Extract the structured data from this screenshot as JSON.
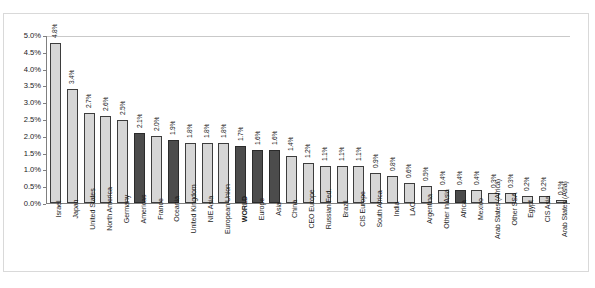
{
  "chart_data": {
    "type": "bar",
    "title": "",
    "subtitle": "",
    "xlabel": "",
    "ylabel": "",
    "ylim": [
      0,
      5.0
    ],
    "ytick_labels": [
      "5.0%",
      "4.5%",
      "4.0%",
      "3.5%",
      "3.0%",
      "2.5%",
      "2.0%",
      "1.5%",
      "1.0%",
      "0.5%",
      "0.0%"
    ],
    "ytick_values": [
      5.0,
      4.5,
      4.0,
      3.5,
      3.0,
      2.5,
      2.0,
      1.5,
      1.0,
      0.5,
      0.0
    ],
    "grid": false,
    "legend": "none",
    "value_label_suffix": "%",
    "colors": {
      "bar_light": "#d6d6d6",
      "bar_dark": "#4c4c4c",
      "bar_border": "#3d3d3d",
      "axis": "#808080",
      "frame": "#d9d9d9",
      "text": "#1a1a1a"
    },
    "categories": [
      "Israel",
      "Japan",
      "United States",
      "North America",
      "Germany",
      "Americas",
      "France",
      "Oceania",
      "United Kingdom",
      "NIE Asia",
      "European Union",
      "WORLD",
      "Europe",
      "Asia",
      "China",
      "CEO Europe",
      "Russian Fed.",
      "Brazil",
      "CIS Europe",
      "South Africa",
      "India",
      "LAC",
      "Argentina",
      "Other in Asia",
      "Africa",
      "Mexico",
      "Arab States (Africa)",
      "Other SSA",
      "Egypt",
      "CIS Asia",
      "Arab States (Asia)"
    ],
    "values": [
      4.8,
      3.4,
      2.7,
      2.6,
      2.5,
      2.1,
      2.0,
      1.9,
      1.8,
      1.8,
      1.8,
      1.7,
      1.6,
      1.6,
      1.4,
      1.2,
      1.1,
      1.1,
      1.1,
      0.9,
      0.8,
      0.6,
      0.5,
      0.4,
      0.4,
      0.4,
      0.3,
      0.3,
      0.2,
      0.2,
      0.1
    ],
    "value_labels": [
      "4.8%",
      "3.4%",
      "2.7%",
      "2.6%",
      "2.5%",
      "2.1%",
      "2.0%",
      "1.9%",
      "1.8%",
      "1.8%",
      "1.8%",
      "1.7%",
      "1.6%",
      "1.6%",
      "1.4%",
      "1.2%",
      "1.1%",
      "1.1%",
      "1.1%",
      "0.9%",
      "0.8%",
      "0.6%",
      "0.5%",
      "0.4%",
      "0.4%",
      "0.4%",
      "0.3%",
      "0.3%",
      "0.2%",
      "0.2%",
      "0.1%"
    ],
    "emphasis": [
      false,
      false,
      false,
      false,
      false,
      true,
      false,
      true,
      false,
      false,
      false,
      true,
      true,
      true,
      false,
      false,
      false,
      false,
      false,
      false,
      false,
      false,
      false,
      false,
      true,
      false,
      false,
      false,
      false,
      false,
      false
    ],
    "bold_labels": [
      false,
      false,
      false,
      false,
      false,
      false,
      false,
      false,
      false,
      false,
      false,
      true,
      false,
      false,
      false,
      false,
      false,
      false,
      false,
      false,
      false,
      false,
      false,
      false,
      false,
      false,
      false,
      false,
      false,
      false,
      false
    ]
  }
}
